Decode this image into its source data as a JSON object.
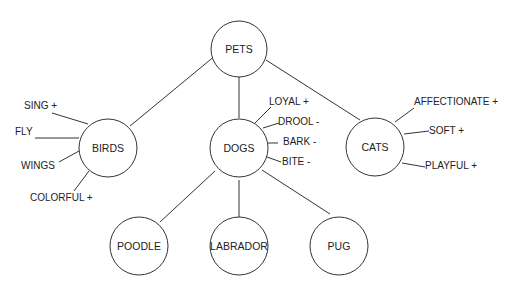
{
  "nodes": {
    "pets": {
      "label": "PETS"
    },
    "birds": {
      "label": "BIRDS"
    },
    "dogs": {
      "label": "DOGS"
    },
    "cats": {
      "label": "CATS"
    },
    "poodle": {
      "label": "POODLE"
    },
    "labrador": {
      "label": "LABRADOR"
    },
    "pug": {
      "label": "PUG"
    }
  },
  "attributes": {
    "birds": [
      "SING +",
      "FLY",
      "WINGS",
      "COLORFUL +"
    ],
    "dogs": [
      "LOYAL +",
      "DROOL -",
      "BARK -",
      "BITE -"
    ],
    "cats": [
      "AFFECTIONATE +",
      "SOFT +",
      "PLAYFUL +"
    ]
  },
  "colors": {
    "stroke": "#333333",
    "text": "#222222",
    "background": "#ffffff"
  }
}
